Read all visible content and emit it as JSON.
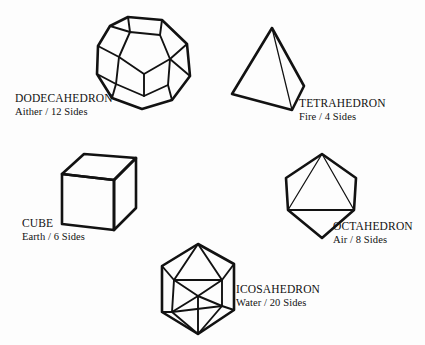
{
  "figure": {
    "kind": "platonic-solids-diagram",
    "background_color": "#fdfdfd",
    "line_color": "#121212"
  },
  "solids": [
    {
      "id": "dodecahedron",
      "name": "DODECAHEDRON",
      "subtitle": "Aither / 12 Sides",
      "element": "Aither",
      "sides": "12 Sides"
    },
    {
      "id": "tetrahedron",
      "name": "TETRAHEDRON",
      "subtitle": "Fire / 4 Sides",
      "element": "Fire",
      "sides": "4 Sides"
    },
    {
      "id": "cube",
      "name": "CUBE",
      "subtitle": "Earth / 6 Sides",
      "element": "Earth",
      "sides": "6 Sides"
    },
    {
      "id": "octahedron",
      "name": "OCTAHEDRON",
      "subtitle": "Air / 8 Sides",
      "element": "Air",
      "sides": "8 Sides"
    },
    {
      "id": "icosahedron",
      "name": "ICOSAHEDRON",
      "subtitle": "Water / 20 Sides",
      "element": "Water",
      "sides": "20 Sides"
    }
  ]
}
